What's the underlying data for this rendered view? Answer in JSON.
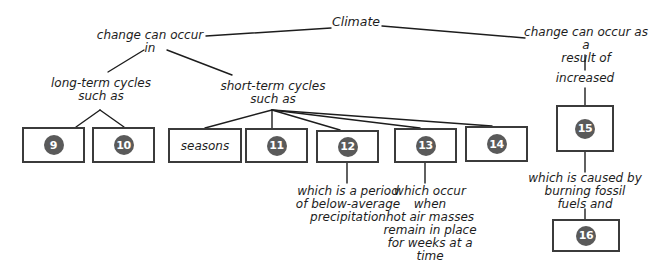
{
  "diagram": {
    "title": "Climate",
    "type": "concept-map",
    "branches": {
      "left_connector": "change can occur\nin",
      "right_connector": "change can occur as a\nresult of"
    },
    "labels": [
      {
        "id": "climate",
        "text": "Climate"
      },
      {
        "id": "change-can-occur-in",
        "text": "change can occur\nin"
      },
      {
        "id": "change-can-occur-as-a-result-of",
        "text": "change can occur as a\nresult of"
      },
      {
        "id": "long-term-cycles-such-as",
        "text": "long-term cycles\nsuch as"
      },
      {
        "id": "short-term-cycles-such-as",
        "text": "short-term cycles\nsuch as"
      },
      {
        "id": "increased",
        "text": "increased"
      },
      {
        "id": "which-is-a-period",
        "text": "which is a period\nof below-average\nprecipitation"
      },
      {
        "id": "which-occur-when",
        "text": "which occur when\nhot air masses\nremain in place\nfor weeks at a\ntime"
      },
      {
        "id": "which-is-caused-by",
        "text": "which is caused by\nburning fossil\nfuels and"
      }
    ],
    "boxes": [
      {
        "id": "box-9",
        "value": "9",
        "kind": "numbered-blank"
      },
      {
        "id": "box-10",
        "value": "10",
        "kind": "numbered-blank"
      },
      {
        "id": "box-seasons",
        "value": "seasons",
        "kind": "text"
      },
      {
        "id": "box-11",
        "value": "11",
        "kind": "numbered-blank"
      },
      {
        "id": "box-12",
        "value": "12",
        "kind": "numbered-blank"
      },
      {
        "id": "box-13",
        "value": "13",
        "kind": "numbered-blank"
      },
      {
        "id": "box-14",
        "value": "14",
        "kind": "numbered-blank"
      },
      {
        "id": "box-15",
        "value": "15",
        "kind": "numbered-blank"
      },
      {
        "id": "box-16",
        "value": "16",
        "kind": "numbered-blank"
      }
    ],
    "colors": {
      "stroke": "#3b3b3b",
      "line": "#1d1d1d",
      "circle_fill": "#5a5a5a",
      "circle_text": "#ffffff",
      "background": "#ffffff"
    }
  }
}
